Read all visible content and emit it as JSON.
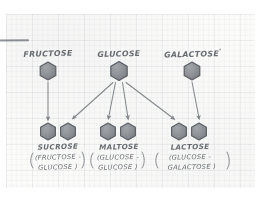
{
  "diagram": {
    "medium": "hand-drawn pencil sketch on graph paper",
    "colors": {
      "paper": "#fbfbfa",
      "grid": "#78848c",
      "ink": "#5d6166",
      "hexagon_fill": "#8c9095",
      "hexagon_stroke": "#5a5f64",
      "rule": "#6f7479"
    },
    "top_rule": {
      "name": "margin-rule",
      "x1": 0,
      "y1": 40,
      "x2": 28,
      "y2": 40
    },
    "monosaccharides": [
      {
        "id": "fructose",
        "label": "FRUCTOSE",
        "superscript": "",
        "hex": {
          "cx": 48,
          "cy": 71,
          "r": 9
        },
        "label_x": 48,
        "label_y": 55
      },
      {
        "id": "glucose",
        "label": "GLUCOSE",
        "superscript": "",
        "hex": {
          "cx": 119,
          "cy": 71,
          "r": 9.5
        },
        "label_x": 119,
        "label_y": 55
      },
      {
        "id": "galactose",
        "label": "GALACTOSE",
        "superscript": "°",
        "hex": {
          "cx": 192,
          "cy": 71,
          "r": 9
        },
        "label_x": 192,
        "label_y": 55
      }
    ],
    "disaccharides": [
      {
        "id": "sucrose",
        "name": "SUCROSE",
        "composition_line1": "(FRUCTOSE -",
        "composition_line2": "GLUCOSE )",
        "hex_left": {
          "cx": 48,
          "cy": 131,
          "r": 8.5
        },
        "hex_right": {
          "cx": 68,
          "cy": 131,
          "r": 8.5
        },
        "name_x": 58,
        "name_y": 148,
        "paren_x": 58,
        "paren_y": 159
      },
      {
        "id": "maltose",
        "name": "MALTOSE",
        "composition_line1": "(GLUCOSE -",
        "composition_line2": "GLUCOSE )",
        "hex_left": {
          "cx": 108,
          "cy": 131,
          "r": 8.5
        },
        "hex_right": {
          "cx": 128,
          "cy": 131,
          "r": 8.5
        },
        "name_x": 118,
        "name_y": 148,
        "paren_x": 118,
        "paren_y": 159
      },
      {
        "id": "lactose",
        "name": "LACTOSE",
        "composition_line1": "(GLUCOSE -",
        "composition_line2": "GALACTOSE )",
        "hex_left": {
          "cx": 179,
          "cy": 131,
          "r": 8.5
        },
        "hex_right": {
          "cx": 199,
          "cy": 131,
          "r": 8.5
        },
        "name_x": 190,
        "name_y": 148,
        "paren_x": 190,
        "paren_y": 159
      }
    ],
    "arrows": [
      {
        "id": "fructose-to-sucrose",
        "from": "fructose",
        "to": "sucrose",
        "x1": 48,
        "y1": 82,
        "x2": 48,
        "y2": 120
      },
      {
        "id": "glucose-to-sucrose",
        "from": "glucose",
        "to": "sucrose",
        "x1": 113,
        "y1": 82,
        "x2": 73,
        "y2": 119
      },
      {
        "id": "glucose-to-maltose-a",
        "from": "glucose",
        "to": "maltose",
        "x1": 116,
        "y1": 82,
        "x2": 108,
        "y2": 119
      },
      {
        "id": "glucose-to-maltose-b",
        "from": "glucose",
        "to": "maltose",
        "x1": 122,
        "y1": 82,
        "x2": 128,
        "y2": 119
      },
      {
        "id": "glucose-to-lactose",
        "from": "glucose",
        "to": "lactose",
        "x1": 126,
        "y1": 82,
        "x2": 174,
        "y2": 120
      },
      {
        "id": "galactose-to-lactose",
        "from": "galactose",
        "to": "lactose",
        "x1": 192,
        "y1": 82,
        "x2": 199,
        "y2": 119
      }
    ]
  }
}
